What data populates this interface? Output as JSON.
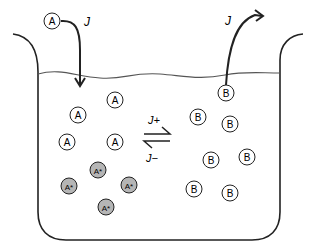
{
  "diagram": {
    "colors": {
      "stroke": "#222222",
      "water_line": "#555555",
      "excited_fill": "#b5b5b5",
      "plain_fill": "#ffffff"
    },
    "flux_in": {
      "label": "J",
      "particle": "A"
    },
    "flux_out": {
      "label": "J",
      "particle": "B"
    },
    "equilibrium": {
      "forward_label": "J+",
      "backward_label": "J−"
    },
    "particles_A": [
      {
        "label": "A",
        "x": 78,
        "y": 115
      },
      {
        "label": "A",
        "x": 115,
        "y": 100
      },
      {
        "label": "A",
        "x": 67,
        "y": 142
      },
      {
        "label": "A",
        "x": 115,
        "y": 142
      }
    ],
    "particles_A_star": [
      {
        "label": "A*",
        "x": 98,
        "y": 170
      },
      {
        "label": "A*",
        "x": 69,
        "y": 186
      },
      {
        "label": "A*",
        "x": 129,
        "y": 185
      },
      {
        "label": "A*",
        "x": 106,
        "y": 207
      }
    ],
    "particles_B": [
      {
        "label": "B",
        "x": 198,
        "y": 117
      },
      {
        "label": "B",
        "x": 230,
        "y": 124
      },
      {
        "label": "B",
        "x": 211,
        "y": 160
      },
      {
        "label": "B",
        "x": 247,
        "y": 157
      },
      {
        "label": "B",
        "x": 194,
        "y": 189
      },
      {
        "label": "B",
        "x": 230,
        "y": 193
      }
    ]
  }
}
